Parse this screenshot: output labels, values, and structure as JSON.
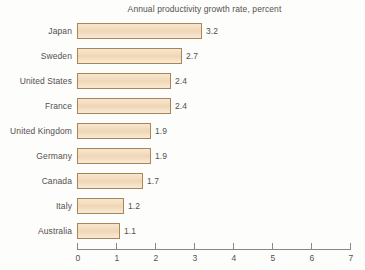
{
  "chart_data": {
    "type": "bar",
    "orientation": "horizontal",
    "title": "Annual productivity growth rate, percent",
    "xlabel": "",
    "ylabel": "",
    "xlim": [
      0,
      7
    ],
    "grid": false,
    "legend": false,
    "xticks": [
      "0",
      "1",
      "2",
      "3",
      "4",
      "5",
      "6",
      "7"
    ],
    "categories": [
      "Japan",
      "Sweden",
      "United States",
      "France",
      "United Kingdom",
      "Germany",
      "Canada",
      "Italy",
      "Australia"
    ],
    "values": [
      3.2,
      2.7,
      2.4,
      2.4,
      1.9,
      1.9,
      1.7,
      1.2,
      1.1
    ],
    "value_labels": [
      "3.2",
      "2.7",
      "2.4",
      "2.4",
      "1.9",
      "1.9",
      "1.7",
      "1.2",
      "1.1"
    ],
    "colors": {
      "bar_fill": "#f2dcc2",
      "bar_border": "#a98558",
      "text": "#55504c",
      "axis": "#8a8680",
      "background": "#fdfdfc"
    }
  }
}
